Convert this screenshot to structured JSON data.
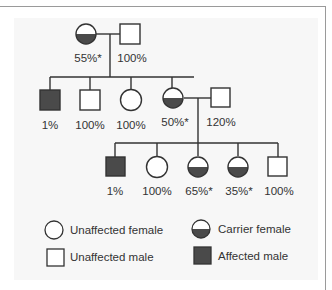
{
  "colors": {
    "line": "#333333",
    "affected_fill": "#4a4a4a",
    "carrier_fill": "#4a4a4a",
    "panel_bg": "#f7f7f7",
    "frame": "#9a9a9a"
  },
  "pedigree": {
    "generation_1": [
      {
        "id": "g1-mother",
        "sex": "female",
        "status": "carrier",
        "label": "55%*"
      },
      {
        "id": "g1-father",
        "sex": "male",
        "status": "unaffected",
        "label": "100%"
      }
    ],
    "generation_2": [
      {
        "id": "g2-son-1",
        "sex": "male",
        "status": "affected",
        "label": "1%"
      },
      {
        "id": "g2-son-2",
        "sex": "male",
        "status": "unaffected",
        "label": "100%"
      },
      {
        "id": "g2-daughter-1",
        "sex": "female",
        "status": "unaffected",
        "label": "100%"
      },
      {
        "id": "g2-daughter-2",
        "sex": "female",
        "status": "carrier",
        "label": "50%*"
      },
      {
        "id": "g2-spouse",
        "sex": "male",
        "status": "unaffected",
        "label": "120%"
      }
    ],
    "generation_3": [
      {
        "id": "g3-son-1",
        "sex": "male",
        "status": "affected",
        "label": "1%"
      },
      {
        "id": "g3-daughter-1",
        "sex": "female",
        "status": "unaffected",
        "label": "100%"
      },
      {
        "id": "g3-daughter-2",
        "sex": "female",
        "status": "carrier",
        "label": "65%*"
      },
      {
        "id": "g3-daughter-3",
        "sex": "female",
        "status": "carrier",
        "label": "35%*"
      },
      {
        "id": "g3-son-2",
        "sex": "male",
        "status": "unaffected",
        "label": "100%"
      }
    ]
  },
  "legend": {
    "unaffected_female": "Unaffected female",
    "carrier_female": "Carrier female",
    "unaffected_male": "Unaffected male",
    "affected_male": "Affected male"
  }
}
